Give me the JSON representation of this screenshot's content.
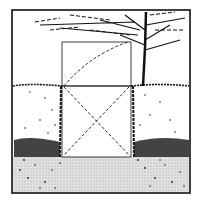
{
  "illustration": {
    "subject": "garden hedge opening with tree and perspective guide lines",
    "colors": {
      "ink": "#111111",
      "paper": "#ffffff",
      "ground": "#d8d8d8"
    }
  }
}
